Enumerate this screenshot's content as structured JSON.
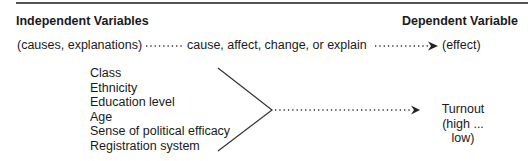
{
  "header": {
    "left_title": "Independent Variables",
    "right_title": "Dependent Variable"
  },
  "relation_row": {
    "left": "(causes, explanations)",
    "middle": "cause, affect, change, or explain",
    "right": "(effect)"
  },
  "independent_variables": [
    "Class",
    "Ethnicity",
    "Education level",
    "Age",
    "Sense of political efficacy",
    "Registration system"
  ],
  "dependent_variable": {
    "name": "Turnout",
    "range": "(high ... low)"
  }
}
